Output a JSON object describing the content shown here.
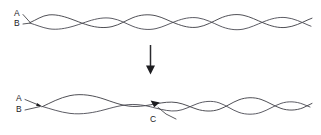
{
  "figure": {
    "background_color": "#ffffff",
    "stroke_color": "#3b3b42",
    "label_color": "#1a1a1c",
    "arrow_color": "#1d1d20",
    "width": 321,
    "height": 135
  },
  "panels": {
    "top": {
      "name": "intertwined-duplex",
      "labels": {
        "strand_a": "A",
        "strand_b": "B"
      },
      "geometry": {
        "x_start": 30,
        "x_end": 312,
        "center_y": 22,
        "amplitude": 7.5,
        "wavelength": 50,
        "lobes": 5.6
      }
    },
    "transition": {
      "name": "downward-transition-arrow",
      "direction": "down",
      "x": 150,
      "y_start": 45,
      "y_end": 74
    },
    "bottom": {
      "name": "partially-unwound-duplex",
      "labels": {
        "strand_a": "A",
        "strand_b": "B",
        "point_c": "C"
      },
      "geometry": {
        "x_start": 42,
        "x_end": 312,
        "center_y": 105,
        "amplitude_left": 9.5,
        "wavelength_left": 84,
        "amplitude_right": 7.0,
        "wavelength_right": 46,
        "transition_x": 158
      },
      "marker": {
        "name": "cleavage-point-arrowhead",
        "x": 155,
        "y": 104
      },
      "leader": {
        "from_x": 176,
        "from_y": 119,
        "to_x": 159,
        "to_y": 107
      }
    }
  }
}
